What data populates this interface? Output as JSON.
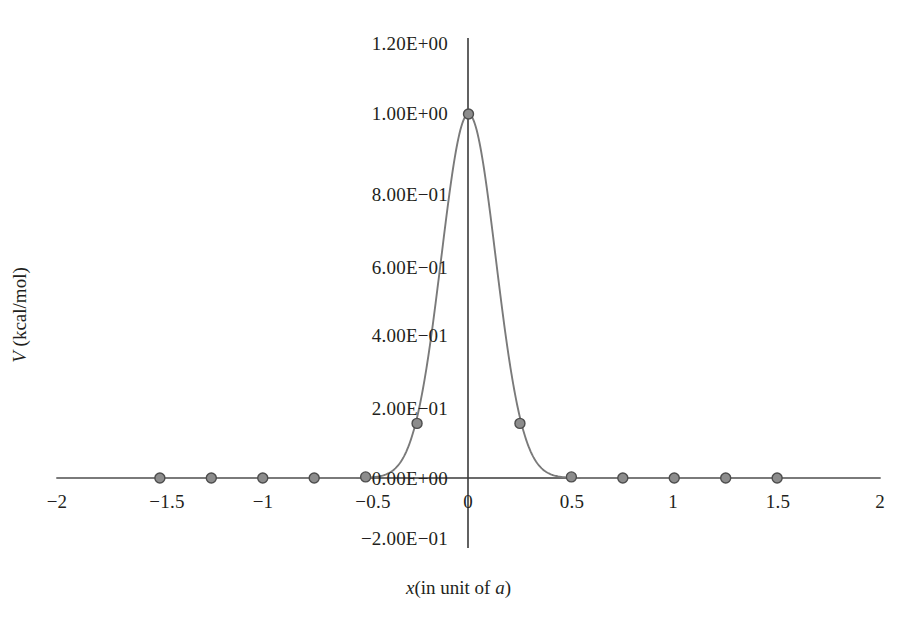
{
  "chart_data": {
    "type": "line",
    "title": "",
    "subtitle": "",
    "xlabel_parts": {
      "symbol": "x",
      "rest": "(in unit of ",
      "unit_symbol": "a",
      "close": ")"
    },
    "xlabel": "x(in unit of a)",
    "ylabel_parts": {
      "symbol": "V",
      "rest": " (kcal/mol)"
    },
    "ylabel": "V (kcal/mol)",
    "xlim": [
      -2,
      2
    ],
    "ylim": [
      -0.2,
      1.2
    ],
    "grid": false,
    "legend": "none",
    "axis_style": "crossed-axes-at-origin",
    "xticks": [
      -2,
      -1.5,
      -1,
      -0.5,
      0,
      0.5,
      1,
      1.5,
      2
    ],
    "xtick_labels": [
      "−2",
      "−1.5",
      "−1",
      "−0.5",
      "0",
      "0.5",
      "1",
      "1.5",
      "2"
    ],
    "yticks": [
      -0.2,
      0,
      0.2,
      0.4,
      0.6,
      0.8,
      1.0,
      1.2
    ],
    "ytick_labels": [
      "−2.00E−01",
      "0.00E+00",
      "2.00E−01",
      "4.00E−01",
      "6.00E−01",
      "8.00E−01",
      "1.00E+00",
      "1.20E+00"
    ],
    "series": [
      {
        "name": "V(x)",
        "marker": "circle",
        "marker_color": "#8c8c8c",
        "marker_edge_color": "#4d4d4d",
        "line_color": "#7a7a7a",
        "x": [
          -1.5,
          -1.25,
          -1,
          -0.75,
          -0.5,
          -0.25,
          0,
          0.25,
          0.5,
          0.75,
          1,
          1.25,
          1.5
        ],
        "values": [
          0,
          0,
          0,
          0,
          0.003,
          0.15,
          1.0,
          0.15,
          0.003,
          0,
          0,
          0,
          0
        ]
      }
    ],
    "colors": {
      "axis": "#3a3a3a",
      "curve": "#7a7a7a",
      "marker_fill": "#8c8c8c",
      "marker_edge": "#4a4a4a",
      "text": "#231f20",
      "background": "#ffffff"
    }
  }
}
